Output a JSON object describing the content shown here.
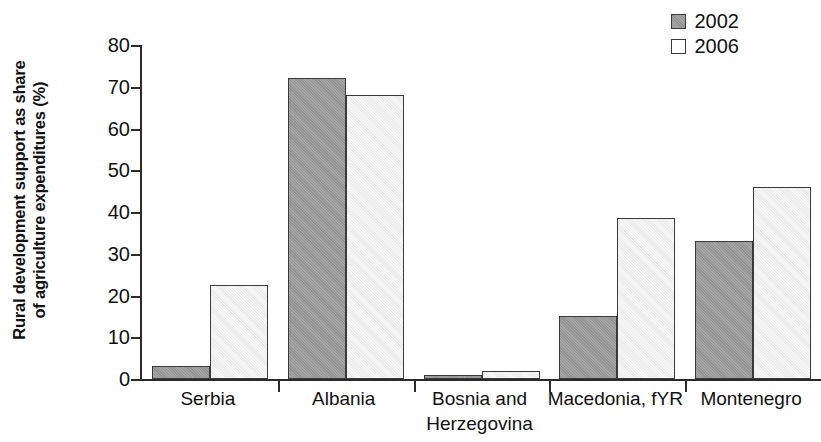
{
  "chart_data": {
    "type": "bar",
    "title": "",
    "subtitle": "",
    "xlabel": "",
    "ylabel": "Rural development support as share of agriculture expenditures (%)",
    "ylabel_lines": [
      "Rural development support as share",
      "of agriculture expenditures (%)"
    ],
    "categories": [
      "Serbia",
      "Albania",
      "Bosnia and Herzegovina",
      "Macedonia, fYR",
      "Montenegro"
    ],
    "category_lines": [
      [
        "Serbia"
      ],
      [
        "Albania"
      ],
      [
        "Bosnia and",
        "Herzegovina"
      ],
      [
        "Macedonia, fYR"
      ],
      [
        "Montenegro"
      ]
    ],
    "series": [
      {
        "name": "2002",
        "color": "#9b9b9b",
        "values": [
          3,
          72,
          1,
          15,
          33
        ]
      },
      {
        "name": "2006",
        "color": "#f1f1f1",
        "values": [
          22.5,
          68,
          2,
          38.5,
          46
        ]
      }
    ],
    "ylim": [
      0,
      80
    ],
    "yticks": [
      0,
      10,
      20,
      30,
      40,
      50,
      60,
      70,
      80
    ],
    "ytick_labels": [
      "0",
      "10",
      "20",
      "30",
      "40",
      "50",
      "60",
      "70",
      "80"
    ],
    "grid": false,
    "legend_position": "top-right",
    "legend_entries": [
      "2002",
      "2006"
    ],
    "bar_border_color": "#3a3a3a",
    "axis_color": "#2b2b2b"
  }
}
